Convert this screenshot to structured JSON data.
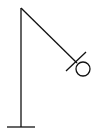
{
  "diagram": {
    "parts": [
      "base",
      "pole",
      "arm",
      "crossbar",
      "circle"
    ],
    "stroke_color": "#111111",
    "background_color": "#ffffff"
  }
}
